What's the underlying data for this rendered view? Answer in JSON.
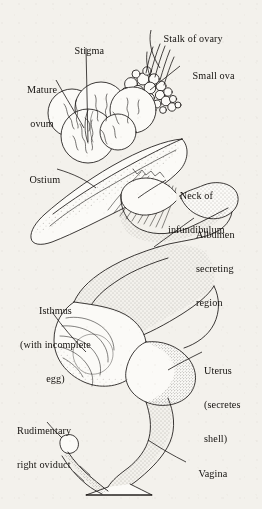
{
  "figure": {
    "style": "ink line drawing with stipple shading",
    "background_color": "#f3f1ec",
    "ink_color": "#1a1715"
  },
  "labels": [
    {
      "id": "stalk-of-ovary",
      "text": "Stalk of ovary",
      "lines": [
        "Stalk of ovary"
      ],
      "align": "left",
      "x": 153,
      "y": 22
    },
    {
      "id": "stigma",
      "text": "Stigma",
      "lines": [
        "Stigma"
      ],
      "align": "center",
      "x": 64,
      "y": 35
    },
    {
      "id": "small-ova",
      "text": "Small ova",
      "lines": [
        "Small ova"
      ],
      "align": "left",
      "x": 182,
      "y": 60
    },
    {
      "id": "mature-ovum",
      "text": "Mature ovum",
      "lines": [
        "Mature",
        "ovum"
      ],
      "align": "center",
      "x": 27,
      "y": 62
    },
    {
      "id": "ostium",
      "text": "Ostium",
      "lines": [
        "Ostium"
      ],
      "align": "left",
      "x": 19,
      "y": 163
    },
    {
      "id": "neck-of-infundibulum",
      "text": "Neck of infundibulum",
      "lines": [
        "Neck of",
        "infundibulum"
      ],
      "align": "center",
      "x": 168,
      "y": 168
    },
    {
      "id": "albumen-secreting-region",
      "text": "Albumen secreting region",
      "lines": [
        "Albumen",
        "secreting",
        "region"
      ],
      "align": "left",
      "x": 196,
      "y": 207
    },
    {
      "id": "isthmus",
      "text": "Isthmus (with incomplete egg)",
      "lines": [
        "Isthmus",
        "(with incomplete",
        "egg)"
      ],
      "align": "center",
      "x": 20,
      "y": 283
    },
    {
      "id": "uterus",
      "text": "Uterus (secretes shell)",
      "lines": [
        "Uterus",
        "(secretes",
        "shell)"
      ],
      "align": "left",
      "x": 204,
      "y": 343
    },
    {
      "id": "rudimentary-right-oviduct",
      "text": "Rudimentary right oviduct",
      "lines": [
        "Rudimentary",
        "right oviduct"
      ],
      "align": "left",
      "x": 17,
      "y": 403
    },
    {
      "id": "vagina",
      "text": "Vagina",
      "lines": [
        "Vagina"
      ],
      "align": "left",
      "x": 188,
      "y": 458
    }
  ],
  "parts": [
    {
      "id": "ovary-cluster",
      "name": "ovary with follicles"
    },
    {
      "id": "mature-ova",
      "name": "mature ova"
    },
    {
      "id": "small-ova",
      "name": "small ova"
    },
    {
      "id": "infundibulum",
      "name": "infundibulum funnel"
    },
    {
      "id": "magnum",
      "name": "albumen secreting region"
    },
    {
      "id": "isthmus",
      "name": "isthmus"
    },
    {
      "id": "uterus",
      "name": "uterus (shell gland)"
    },
    {
      "id": "vagina",
      "name": "vagina"
    },
    {
      "id": "cloaca",
      "name": "cloaca opening"
    },
    {
      "id": "rudimentary-oviduct",
      "name": "rudimentary right oviduct"
    }
  ],
  "caption": {
    "text": ""
  }
}
